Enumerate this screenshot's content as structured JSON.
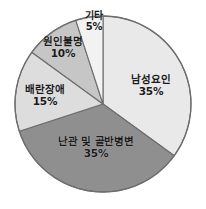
{
  "chart_data": {
    "type": "pie",
    "title": "",
    "subtitle": "",
    "xlabel": "",
    "ylabel": "",
    "legend_position": "none",
    "grid": false,
    "start_angle_deg": 0,
    "direction": "clockwise",
    "units": "%",
    "categories": [
      "남성요인",
      "난관 및 골반병변",
      "배란장애",
      "원인불명",
      "기타"
    ],
    "values": [
      35,
      35,
      15,
      10,
      5
    ],
    "value_labels": [
      "35%",
      "35%",
      "15%",
      "10%",
      "5%"
    ],
    "colors": [
      "#e9e9e9",
      "#8f8f8f",
      "#dddddd",
      "#c6c6c6",
      "#f2f2f2"
    ],
    "slices": [
      {
        "name": "남성요인",
        "value": 35,
        "value_label": "35%",
        "color": "#e9e9e9",
        "start_deg": 0,
        "end_deg": 126
      },
      {
        "name": "난관 및 골반병변",
        "value": 35,
        "value_label": "35%",
        "color": "#8f8f8f",
        "start_deg": 126,
        "end_deg": 252
      },
      {
        "name": "배란장애",
        "value": 15,
        "value_label": "15%",
        "color": "#dddddd",
        "start_deg": 252,
        "end_deg": 306
      },
      {
        "name": "원인불명",
        "value": 10,
        "value_label": "10%",
        "color": "#c6c6c6",
        "start_deg": 306,
        "end_deg": 342
      },
      {
        "name": "기타",
        "value": 5,
        "value_label": "5%",
        "color": "#f2f2f2",
        "start_deg": 342,
        "end_deg": 360
      }
    ],
    "outline_color": "#6e6e6e",
    "background": "#ffffff"
  }
}
